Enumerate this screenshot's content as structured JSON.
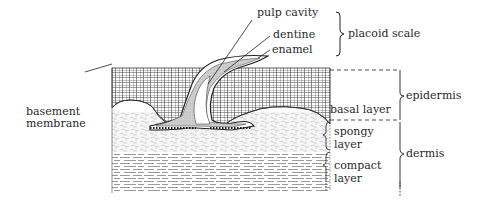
{
  "diagram": {
    "labels": {
      "pulp_cavity": "pulp cavity",
      "dentine": "dentine",
      "enamel": "enamel",
      "placoid_scale": "placoid scale",
      "epidermis": "epidermis",
      "basal_layer": "basal layer",
      "basement_membrane_1": "basement",
      "basement_membrane_2": "membrane",
      "spongy_layer_1": "spongy",
      "spongy_layer_2": "layer",
      "compact_layer_1": "compact",
      "compact_layer_2": "layer",
      "dermis": "dermis"
    },
    "colors": {
      "ink": "#2a2a2a",
      "scale_fill": "#cfcfcf",
      "cell_fill": "#ffffff",
      "spongy_fill": "#f4f4f4"
    }
  }
}
